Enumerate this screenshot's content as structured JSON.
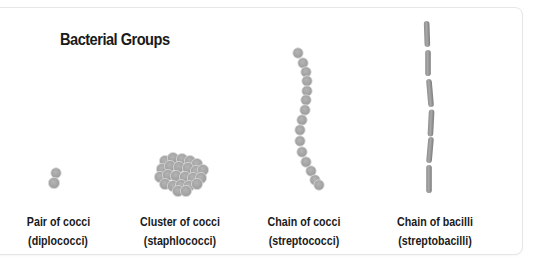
{
  "title": "Bacterial Groups",
  "colors": {
    "cell_fill": "#a9a9a9",
    "cell_stroke": "#d9d9d9",
    "text": "#1a1a1a",
    "border": "#e6e6e6"
  },
  "groups": [
    {
      "id": "diplococci",
      "name": "Pair of cocci",
      "term": "(diplococci)",
      "shape": "cocci-pair"
    },
    {
      "id": "staphylococci",
      "name": "Cluster of cocci",
      "term": "(staphlococci)",
      "shape": "cocci-cluster"
    },
    {
      "id": "streptococci",
      "name": "Chain of cocci",
      "term": "(streptococci)",
      "shape": "cocci-chain"
    },
    {
      "id": "streptobacilli",
      "name": "Chain of bacilli",
      "term": "(streptobacilli)",
      "shape": "bacilli-chain"
    }
  ]
}
